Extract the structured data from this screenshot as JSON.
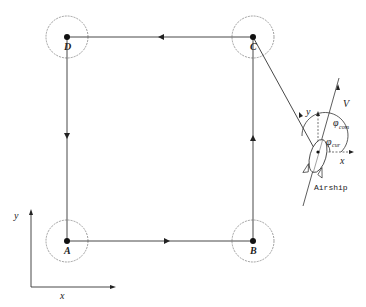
{
  "diagram": {
    "type": "airship waypoint path diagram",
    "waypoints": [
      {
        "id": "D",
        "label": "D",
        "x": 67,
        "y": 37
      },
      {
        "id": "C",
        "label": "C",
        "x": 253,
        "y": 37
      },
      {
        "id": "A",
        "label": "A",
        "x": 67,
        "y": 241
      },
      {
        "id": "B",
        "label": "B",
        "x": 253,
        "y": 241
      }
    ],
    "path_order": [
      "A",
      "B",
      "C",
      "D",
      "A"
    ],
    "airship": {
      "label": "Airship",
      "velocity_label": "V",
      "local_y_label": "y",
      "local_x_label": "x",
      "angle_com_label": "φ",
      "angle_com_sub": "com",
      "angle_cur_label": "φ",
      "angle_cur_sub": "cur"
    },
    "global_axes": {
      "x_label": "x",
      "y_label": "y"
    },
    "colors": {
      "line": "#333333",
      "circle": "#777777",
      "point": "#111111",
      "background": "#ffffff"
    }
  }
}
